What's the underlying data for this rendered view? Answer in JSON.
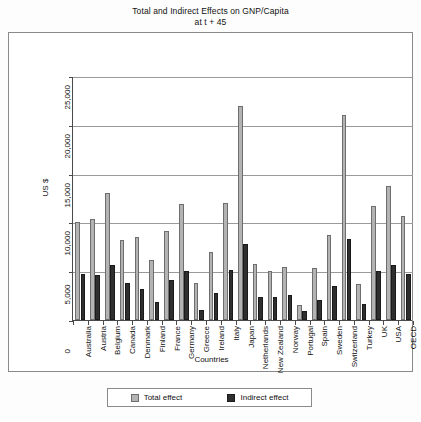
{
  "chart_data": {
    "type": "bar",
    "title": "Total and Indirect Effects on GNP/Capita",
    "subtitle": "at t + 45",
    "xlabel": "Countries",
    "ylabel": "US $",
    "ylim": [
      0,
      25000
    ],
    "yticks": [
      "0",
      "5,000",
      "10,000",
      "15,000",
      "20,000",
      "25,000"
    ],
    "ytick_values": [
      0,
      5000,
      10000,
      15000,
      20000,
      25000
    ],
    "grid": true,
    "legend_position": "bottom",
    "categories": [
      "Australia",
      "Austria",
      "Belgium",
      "Canada",
      "Denmark",
      "Finland",
      "France",
      "Germany",
      "Greece",
      "Ireland",
      "Italy",
      "Japan",
      "Netherlands",
      "New Zealand",
      "Norway",
      "Portugal",
      "Spain",
      "Sweden",
      "Switzerland",
      "Turkey",
      "UK",
      "USA",
      "OECD"
    ],
    "series": [
      {
        "name": "Total effect",
        "color": "#b3b3b3",
        "values": [
          10000,
          10400,
          13000,
          8200,
          8500,
          6200,
          9100,
          11900,
          3800,
          7000,
          12000,
          21900,
          5700,
          5000,
          5400,
          1500,
          5300,
          8700,
          21000,
          3700,
          11700,
          13700,
          10700
        ]
      },
      {
        "name": "Indirect effect",
        "color": "#2f2f2f",
        "values": [
          4700,
          4600,
          5600,
          3800,
          3200,
          1800,
          4100,
          5000,
          1000,
          2800,
          5100,
          7800,
          2400,
          2400,
          2600,
          900,
          2000,
          3500,
          8300,
          1600,
          5000,
          5600,
          4700
        ]
      }
    ]
  },
  "legend": {
    "items": [
      {
        "label": "Total effect"
      },
      {
        "label": "Indirect effect"
      }
    ]
  }
}
